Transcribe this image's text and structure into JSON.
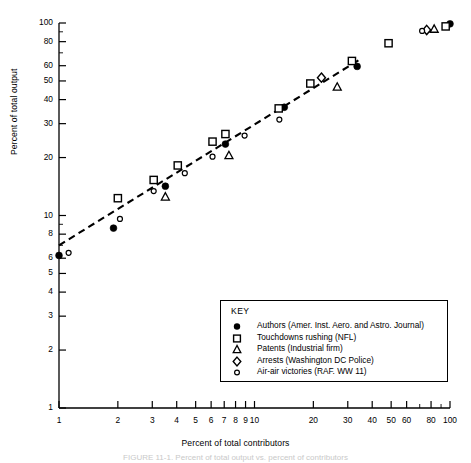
{
  "chart_data": {
    "type": "scatter",
    "title": "",
    "xlabel": "Percent of total contributors",
    "ylabel": "Percent of total output",
    "xscale": "log",
    "yscale": "log",
    "xlim": [
      1,
      100
    ],
    "ylim": [
      1,
      100
    ],
    "grid": false,
    "xticks": [
      1,
      2,
      3,
      4,
      5,
      6,
      7,
      8,
      9,
      10,
      20,
      30,
      40,
      50,
      60,
      80,
      100
    ],
    "xtick_labels": [
      "1",
      "2",
      "3",
      "4",
      "5",
      "6",
      "7",
      "8",
      "9",
      "10",
      "20",
      "30",
      "40",
      "50",
      "60",
      "80",
      "100"
    ],
    "yticks": [
      1,
      2,
      3,
      4,
      5,
      6,
      8,
      10,
      20,
      30,
      40,
      50,
      60,
      80,
      100
    ],
    "ytick_labels": [
      "1",
      "2",
      "3",
      "4",
      "5",
      "6",
      "8",
      "10",
      "20",
      "30",
      "40",
      "50",
      "60",
      "80",
      "100"
    ],
    "legend_position": "lower-right",
    "legend_title": "KEY",
    "trendline": {
      "style": "dashed",
      "label": "",
      "x": [
        1.0,
        34.0
      ],
      "y": [
        7.0,
        64.0
      ]
    },
    "series": [
      {
        "name": "Authors (Amer. Inst. Aero. and Astro. Journal)",
        "marker": "filled-circle",
        "points": [
          {
            "x": 1.0,
            "y": 6.2
          },
          {
            "x": 1.9,
            "y": 8.6
          },
          {
            "x": 3.5,
            "y": 14.2
          },
          {
            "x": 7.1,
            "y": 23.5
          },
          {
            "x": 14.2,
            "y": 36.5
          },
          {
            "x": 33.5,
            "y": 59.5
          },
          {
            "x": 100.0,
            "y": 99.0
          }
        ]
      },
      {
        "name": "Touchdowns rushing (NFL)",
        "marker": "open-square",
        "points": [
          {
            "x": 2.0,
            "y": 12.3
          },
          {
            "x": 3.05,
            "y": 15.3
          },
          {
            "x": 4.05,
            "y": 18.2
          },
          {
            "x": 7.1,
            "y": 26.5
          },
          {
            "x": 6.1,
            "y": 24.2
          },
          {
            "x": 13.3,
            "y": 36.0
          },
          {
            "x": 19.3,
            "y": 48.5
          },
          {
            "x": 31.5,
            "y": 63.5
          },
          {
            "x": 48.5,
            "y": 78.5
          },
          {
            "x": 95.0,
            "y": 96.0
          }
        ]
      },
      {
        "name": "Patents (Industrial firm)",
        "marker": "open-triangle",
        "points": [
          {
            "x": 3.5,
            "y": 12.5
          },
          {
            "x": 7.4,
            "y": 20.5
          },
          {
            "x": 26.5,
            "y": 46.5
          },
          {
            "x": 83.0,
            "y": 93.0
          }
        ]
      },
      {
        "name": "Arrests (Washington DC Police)",
        "marker": "open-diamond",
        "points": [
          {
            "x": 22.0,
            "y": 52.0
          },
          {
            "x": 76.0,
            "y": 92.0
          }
        ]
      },
      {
        "name": "Air-air victories (RAF. WW 11)",
        "marker": "small-open-circle",
        "points": [
          {
            "x": 1.12,
            "y": 6.4
          },
          {
            "x": 2.05,
            "y": 9.6
          },
          {
            "x": 3.05,
            "y": 13.4
          },
          {
            "x": 4.4,
            "y": 16.6
          },
          {
            "x": 6.1,
            "y": 20.2
          },
          {
            "x": 8.9,
            "y": 26.0
          },
          {
            "x": 13.4,
            "y": 31.5
          },
          {
            "x": 72.0,
            "y": 91.0
          }
        ]
      }
    ]
  },
  "legend": {
    "title": "KEY",
    "items": [
      {
        "marker": "filled-circle",
        "label": "Authors (Amer. Inst. Aero. and Astro. Journal)"
      },
      {
        "marker": "open-square",
        "label": "Touchdowns rushing (NFL)"
      },
      {
        "marker": "open-triangle",
        "label": "Patents (Industrial firm)"
      },
      {
        "marker": "open-diamond",
        "label": "Arrests (Washington DC Police)"
      },
      {
        "marker": "small-open-circle",
        "label": "Air-air victories (RAF. WW 11)"
      }
    ]
  },
  "colors": {
    "ink": "#000000",
    "axis": "#000000",
    "background": "#ffffff",
    "caption": "#c9c9c9"
  },
  "caption": "FIGURE 11-1. Percent of total output vs. percent of contributors"
}
